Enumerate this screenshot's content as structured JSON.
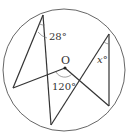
{
  "diagram": {
    "type": "circle-geometry",
    "circle": {
      "cx": 64,
      "cy": 70,
      "r": 61
    },
    "points": {
      "A": {
        "x": 43,
        "y": 15
      },
      "B": {
        "x": 13,
        "y": 88
      },
      "C": {
        "x": 51,
        "y": 125
      },
      "O": {
        "x": 65,
        "y": 68
      },
      "D": {
        "x": 109,
        "y": 34
      },
      "E": {
        "x": 109,
        "y": 106
      }
    },
    "labels": {
      "center": "O",
      "angle_a": "28°",
      "angle_o": "120°",
      "angle_x": "x°"
    },
    "colors": {
      "stroke": "#333333",
      "circle": "#555555",
      "arc": "#777777"
    }
  }
}
